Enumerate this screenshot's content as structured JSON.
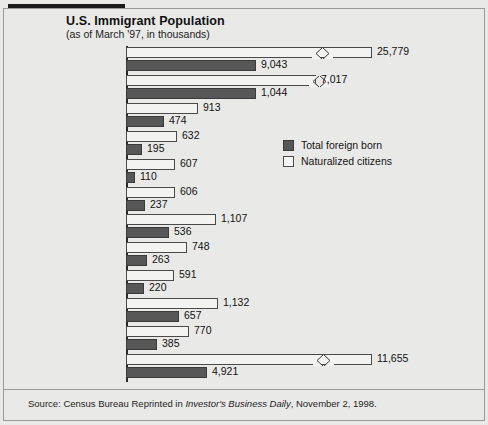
{
  "header": {
    "title": "U.S. Immigrant Population",
    "subtitle": "(as of March '97, in thousands)"
  },
  "legend": {
    "dark_label": "Total foreign born",
    "light_label": "Naturalized citizens"
  },
  "footer": {
    "source_prefix": "Source: Census Bureau Reprinted in ",
    "source_italic": "Investor's Business Daily",
    "source_suffix": ", November 2, 1998."
  },
  "colors": {
    "dark_bar": "#575757",
    "light_bar": "#f3f3f1",
    "bar_outline": "#3a3a3a",
    "background": "#e9e9e7",
    "axis": "#2a2a2a"
  },
  "chart_data": {
    "type": "bar",
    "orientation": "horizontal",
    "title": "U.S. Immigrant Population",
    "subtitle": "(as of March '97, in thousands)",
    "xlabel": "",
    "ylabel": "",
    "units": "thousands",
    "grid": false,
    "legend_position": "middle-right",
    "axis_break": true,
    "axis_break_note": "Bars for All (25,779), Mexico (7,017) and Elsewhere (11,655) are drawn with a zigzag scale break.",
    "categories": [
      "All",
      "Mexico",
      "Cuba",
      "Dominican Republic",
      "El Salvador",
      "Great Britain",
      "China and Hong Kong",
      "India",
      "Korea",
      "Philippines",
      "Vietnam",
      "Elsewhere"
    ],
    "series": [
      {
        "name": "Naturalized citizens",
        "style": "light",
        "values": [
          25779,
          7017,
          913,
          632,
          607,
          606,
          1107,
          748,
          591,
          1132,
          770,
          11655
        ],
        "labels": [
          "25,779",
          "7,017",
          "913",
          "632",
          "607",
          "606",
          "1,107",
          "748",
          "591",
          "1,132",
          "770",
          "11,655"
        ]
      },
      {
        "name": "Total foreign born",
        "style": "dark",
        "values": [
          9043,
          1044,
          474,
          195,
          110,
          237,
          536,
          263,
          220,
          657,
          385,
          4921
        ],
        "labels": [
          "9,043",
          "1,044",
          "474",
          "195",
          "110",
          "237",
          "536",
          "263",
          "220",
          "657",
          "385",
          "4,921"
        ]
      }
    ]
  },
  "rows": [
    {
      "cat": "All",
      "cat2": "",
      "light": "25,779",
      "dark": "9,043",
      "lw": 246,
      "dw": 130,
      "break": 185
    },
    {
      "cat": "Mexico",
      "cat2": "",
      "light": "7,017",
      "dark": "1,044",
      "lw": 190,
      "dw": 130,
      "break": 182
    },
    {
      "cat": "Cuba",
      "cat2": "",
      "light": "913",
      "dark": "474",
      "lw": 72,
      "dw": 38,
      "break": 0
    },
    {
      "cat": "Dominican",
      "cat2": "Republic",
      "light": "632",
      "dark": "195",
      "lw": 51,
      "dw": 16,
      "break": 0
    },
    {
      "cat": "El Salvador",
      "cat2": "",
      "light": "607",
      "dark": "110",
      "lw": 49,
      "dw": 9,
      "break": 0
    },
    {
      "cat": "Great Britain",
      "cat2": "",
      "light": "606",
      "dark": "237",
      "lw": 49,
      "dw": 19,
      "break": 0
    },
    {
      "cat": "China and",
      "cat2": "Hong Kong",
      "light": "1,107",
      "dark": "536",
      "lw": 90,
      "dw": 43,
      "break": 0
    },
    {
      "cat": "India",
      "cat2": "",
      "light": "748",
      "dark": "263",
      "lw": 61,
      "dw": 21,
      "break": 0
    },
    {
      "cat": "Korea",
      "cat2": "",
      "light": "591",
      "dark": "220",
      "lw": 48,
      "dw": 18,
      "break": 0
    },
    {
      "cat": "Philippines",
      "cat2": "",
      "light": "1,132",
      "dark": "657",
      "lw": 92,
      "dw": 53,
      "break": 0
    },
    {
      "cat": "Vietnam",
      "cat2": "",
      "light": "770",
      "dark": "385",
      "lw": 63,
      "dw": 31,
      "break": 0
    },
    {
      "cat": "Elsewhere",
      "cat2": "",
      "light": "11,655",
      "dark": "4,921",
      "lw": 246,
      "dw": 81,
      "break": 186
    }
  ]
}
